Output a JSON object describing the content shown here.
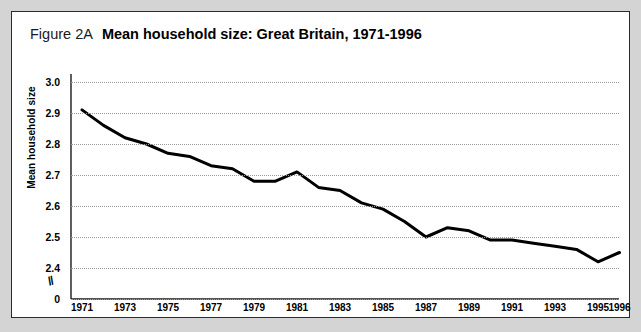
{
  "figure": {
    "number": "Figure 2A",
    "title": "Mean household size: Great Britain, 1971-1996"
  },
  "axis_break_symbol": "//",
  "colors": {
    "page_background": "#d4d4d4",
    "panel_background": "#ffffff",
    "border": "#2b2b2b",
    "line": "#000000",
    "gridline": "#9a9a9a",
    "text": "#000000"
  },
  "chart_data": {
    "type": "line",
    "title": "Mean household size: Great Britain, 1971-1996",
    "xlabel": "",
    "ylabel": "Mean household size",
    "grid": true,
    "legend": null,
    "ylim": [
      2.4,
      3.0
    ],
    "yticks": [
      "3.0",
      "2.9",
      "2.8",
      "2.7",
      "2.6",
      "2.5",
      "2.4",
      "0"
    ],
    "ytick_values": [
      3.0,
      2.9,
      2.8,
      2.7,
      2.6,
      2.5,
      2.4,
      0
    ],
    "axis_break_between": [
      2.4,
      0
    ],
    "xtick_labels": [
      "1971",
      "1973",
      "1975",
      "1977",
      "1979",
      "1981",
      "1983",
      "1985",
      "1987",
      "1989",
      "1991",
      "1993",
      "1995",
      "1996"
    ],
    "x": [
      1971,
      1972,
      1973,
      1974,
      1975,
      1976,
      1977,
      1978,
      1979,
      1980,
      1981,
      1982,
      1983,
      1984,
      1985,
      1986,
      1987,
      1988,
      1989,
      1990,
      1991,
      1992,
      1993,
      1994,
      1995,
      1996
    ],
    "values": [
      2.91,
      2.86,
      2.82,
      2.8,
      2.77,
      2.76,
      2.73,
      2.72,
      2.68,
      2.68,
      2.71,
      2.66,
      2.65,
      2.61,
      2.59,
      2.55,
      2.5,
      2.53,
      2.52,
      2.49,
      2.49,
      2.48,
      2.47,
      2.46,
      2.42,
      2.45
    ]
  }
}
